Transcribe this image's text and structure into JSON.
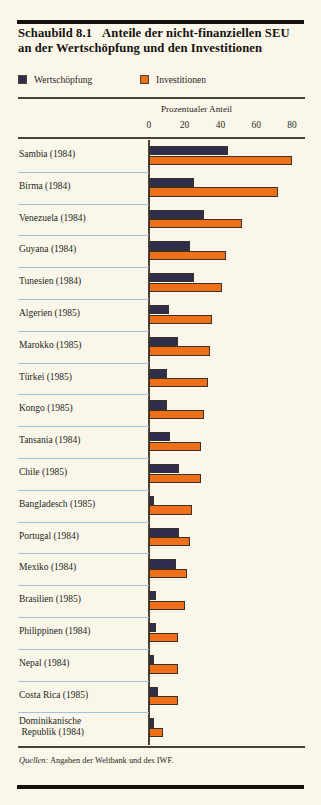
{
  "figure": {
    "number": "Schaubild 8.1",
    "title_rest": "Anteile der nicht-finanziellen SEU an der Wertschöpfung und den Investitionen",
    "source": "Quellen:",
    "source_rest": " Angaben der Weltbank und des IWF."
  },
  "legend": {
    "items": [
      {
        "label": "Wertschöpfung",
        "color": "#2e2d4e",
        "key": "wertschoepfung"
      },
      {
        "label": "Investitionen",
        "color": "#f0701a",
        "key": "investitionen"
      }
    ]
  },
  "axis": {
    "caption": "Prozentualer Anteil",
    "ticks": [
      "0",
      "20",
      "40",
      "60",
      "80"
    ]
  },
  "colors": {
    "background": "#faf7ea",
    "rule": "#14100c",
    "separator": "#9dc4de",
    "dark_series": "#2e2d4e",
    "orange_series": "#f0701a"
  },
  "chart_data": {
    "type": "bar",
    "orientation": "horizontal",
    "xlabel": "Prozentualer Anteil",
    "ylabel": "",
    "xlim": [
      0,
      80
    ],
    "xticks": [
      0,
      20,
      40,
      60,
      80
    ],
    "grid": false,
    "legend_position": "top-left",
    "categories": [
      "Sambia (1984)",
      "Birma (1984)",
      "Venezuela (1984)",
      "Guyana (1984)",
      "Tunesien (1984)",
      "Algerien (1985)",
      "Marokko (1985)",
      "Türkei (1985)",
      "Kongo (1985)",
      "Tansania (1984)",
      "Chile (1985)",
      "Bangladesch (1985)",
      "Portugal (1984)",
      "Mexiko (1984)",
      "Brasilien (1985)",
      "Philippinen (1984)",
      "Nepal (1984)",
      "Costa Rica (1985)",
      "Dominikanische Republik (1984)"
    ],
    "series": [
      {
        "name": "Wertschöpfung",
        "color": "#2e2d4e",
        "values": [
          44,
          25,
          31,
          23,
          25,
          11,
          16,
          10,
          10,
          12,
          17,
          3,
          17,
          15,
          4,
          4,
          3,
          5,
          3
        ]
      },
      {
        "name": "Investitionen",
        "color": "#f0701a",
        "values": [
          80,
          72,
          52,
          43,
          41,
          35,
          34,
          33,
          31,
          29,
          29,
          24,
          23,
          21,
          20,
          16,
          16,
          16,
          8
        ]
      }
    ],
    "source": "Quellen: Angaben der Weltbank und des IWF."
  }
}
